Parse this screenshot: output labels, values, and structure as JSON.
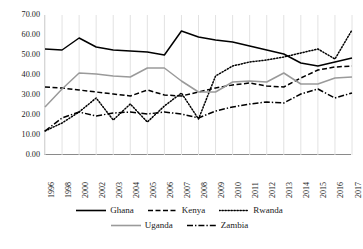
{
  "chart_data": {
    "type": "line",
    "title": "",
    "xlabel": "",
    "ylabel": "",
    "ylim": [
      0,
      70
    ],
    "ytick_step": 10,
    "grid": "vertical",
    "legend_position": "bottom",
    "ytick_labels": [
      "70.00",
      "60.00",
      "50.00",
      "40.00",
      "30.00",
      "20.00",
      "10.00",
      "0.00"
    ],
    "categories": [
      "1996",
      "1998",
      "2000",
      "2002",
      "2003",
      "2004",
      "2005",
      "2006",
      "2007",
      "2008",
      "2009",
      "2010",
      "2011",
      "2012",
      "2013",
      "2014",
      "2015",
      "2016",
      "2017"
    ],
    "series": [
      {
        "name": "Ghana",
        "style": "solid",
        "color": "#000000",
        "values": [
          53.0,
          52.5,
          58.5,
          54.0,
          52.5,
          52.0,
          51.5,
          50.0,
          62.0,
          59.0,
          57.5,
          56.5,
          54.5,
          52.5,
          50.5,
          46.0,
          44.5,
          46.5,
          48.5
        ]
      },
      {
        "name": "Kenya",
        "style": "dashed",
        "color": "#000000",
        "values": [
          34.0,
          33.5,
          32.5,
          31.5,
          30.5,
          29.5,
          32.5,
          30.0,
          29.5,
          31.5,
          33.5,
          35.0,
          36.0,
          34.5,
          34.0,
          38.5,
          42.5,
          44.0,
          44.5
        ]
      },
      {
        "name": "Rwanda",
        "style": "dotted",
        "color": "#000000",
        "values": [
          12.0,
          16.0,
          21.5,
          28.5,
          17.5,
          25.5,
          16.5,
          24.5,
          31.0,
          18.0,
          39.5,
          44.5,
          46.5,
          47.5,
          49.0,
          51.0,
          53.0,
          48.0,
          62.5
        ]
      },
      {
        "name": "Uganda",
        "style": "solid",
        "color": "#9a9a9a",
        "values": [
          24.0,
          33.0,
          41.0,
          40.5,
          39.5,
          39.0,
          43.5,
          43.5,
          37.0,
          31.5,
          31.5,
          36.5,
          37.0,
          36.5,
          41.0,
          35.5,
          35.5,
          38.5,
          39.0
        ]
      },
      {
        "name": "Zambia",
        "style": "dashdot",
        "color": "#000000",
        "values": [
          12.0,
          18.5,
          21.5,
          19.5,
          21.0,
          21.5,
          20.5,
          21.5,
          20.5,
          18.5,
          22.0,
          24.0,
          25.5,
          26.5,
          26.0,
          30.5,
          33.0,
          28.5,
          31.0
        ]
      }
    ]
  }
}
